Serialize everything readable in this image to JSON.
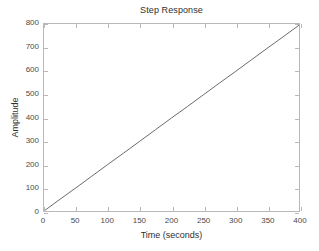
{
  "chart_data": {
    "type": "line",
    "title": "Step Response",
    "xlabel": "Time (seconds)",
    "ylabel": "Amplitude",
    "xlim": [
      0,
      400
    ],
    "ylim": [
      0,
      800
    ],
    "xticks": [
      0,
      50,
      100,
      150,
      200,
      250,
      300,
      350,
      400
    ],
    "yticks": [
      0,
      100,
      200,
      300,
      400,
      500,
      600,
      700,
      800
    ],
    "xtick_labels": [
      "0",
      "50",
      "100",
      "150",
      "200",
      "250",
      "300",
      "350",
      "400"
    ],
    "ytick_labels": [
      "0",
      "100",
      "200",
      "300",
      "400",
      "500",
      "600",
      "700",
      "800"
    ],
    "grid": false,
    "legend": null,
    "series": [
      {
        "name": "step response",
        "color": "#5a5a5a",
        "x": [
          0,
          25,
          50,
          75,
          100,
          125,
          150,
          175,
          200,
          225,
          250,
          275,
          300,
          325,
          350,
          375,
          400
        ],
        "y": [
          0,
          50,
          99,
          149,
          199,
          248,
          298,
          348,
          398,
          447,
          497,
          547,
          596,
          646,
          696,
          745,
          795
        ]
      }
    ]
  },
  "axis": {
    "box_color": "#b9b9b9",
    "tick_color": "#b9b9b9",
    "text_color": "#4a4a4a"
  },
  "figure": {
    "background": "#ffffff"
  }
}
